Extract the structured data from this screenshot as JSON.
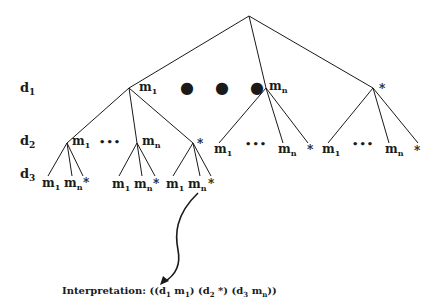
{
  "diagram": {
    "levels": [
      {
        "base": "d",
        "sub": "1"
      },
      {
        "base": "d",
        "sub": "2"
      },
      {
        "base": "d",
        "sub": "3"
      }
    ],
    "symbols": {
      "m": "m",
      "first_sub": "1",
      "last_sub": "n",
      "star": "*",
      "ellipsis": "•••",
      "big_ellipsis": "● ● ●"
    },
    "interpretation": {
      "label": "Interpretation:",
      "open": "((",
      "d1": "d",
      "d1_sub": "1",
      "m1": "m",
      "m1_sub": "1",
      "close1": ")",
      "open2": "(",
      "d2": "d",
      "d2_sub": "2",
      "star": "*",
      "close2": ")",
      "open3": "(",
      "d3": "d",
      "d3_sub": "3",
      "mn": "m",
      "mn_sub": "n",
      "close3": "))"
    },
    "line_color": "#1a1a1a"
  }
}
